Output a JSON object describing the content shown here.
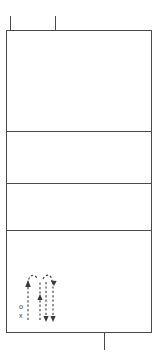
{
  "drawing": {
    "title": "Sectional floor plan with circulation arrows",
    "type": "architectural-plan",
    "stroke_color": "#4a4a4a",
    "background_color": "#ffffff",
    "accent_color": "#3a3a3a"
  },
  "plan": {
    "outline": {
      "x": 6,
      "y": 30,
      "width": 146,
      "height": 303
    },
    "bands": [
      {
        "name": "band-upper",
        "top": 30,
        "bottom": 131,
        "label": ""
      },
      {
        "name": "band-second",
        "top": 131,
        "bottom": 183,
        "label": ""
      },
      {
        "name": "band-third",
        "top": 183,
        "bottom": 230,
        "label": ""
      },
      {
        "name": "band-lower",
        "top": 230,
        "bottom": 333,
        "label": ""
      }
    ],
    "dividers": [
      {
        "name": "divider-1",
        "y": 131
      },
      {
        "name": "divider-2",
        "y": 183
      },
      {
        "name": "divider-3",
        "y": 230
      }
    ]
  },
  "grid_ticks": {
    "top": [
      {
        "name": "tick-top-left",
        "x": 10,
        "y1": 16,
        "y2": 30
      },
      {
        "name": "tick-top-mid",
        "x": 55,
        "y1": 16,
        "y2": 30
      }
    ],
    "bottom": [
      {
        "name": "tick-bottom-mid",
        "x": 104,
        "y1": 333,
        "y2": 350
      }
    ]
  },
  "circulation": {
    "name": "circulation-arrow-diagram",
    "origin": {
      "x": 20,
      "y": 268
    },
    "markers": [
      {
        "name": "marker-o",
        "symbol": "o",
        "x": 19,
        "y": 306
      },
      {
        "name": "marker-x",
        "symbol": "x",
        "x": 19,
        "y": 315
      }
    ],
    "arrows": [
      {
        "name": "arrow-up-left",
        "direction": "up",
        "style": "dashed"
      },
      {
        "name": "arrow-up-center",
        "direction": "up",
        "style": "dashed"
      },
      {
        "name": "arrow-down-center",
        "direction": "down",
        "style": "dashed"
      },
      {
        "name": "arrow-down-right",
        "direction": "down",
        "style": "dashed"
      },
      {
        "name": "arrow-loop-left",
        "direction": "curved",
        "style": "dashed"
      },
      {
        "name": "arrow-loop-right",
        "direction": "curved",
        "style": "dashed"
      }
    ]
  }
}
